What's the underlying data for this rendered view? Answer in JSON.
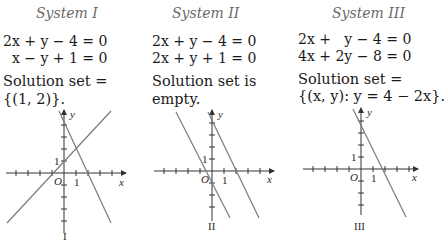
{
  "systems": [
    {
      "title": "System I",
      "equations": [
        "2x + y − 4 = 0",
        "  x − y + 1 = 0"
      ],
      "solution_line1": "Solution set =",
      "solution_line2": "{(1, 2)}.",
      "graph_label": "I",
      "axis_x": "x",
      "axis_y": "y",
      "origin": "O",
      "tick_x": "1",
      "tick_y": "1"
    },
    {
      "title": "System II",
      "equations": [
        "2x + y − 4 = 0",
        "2x + y + 1 = 0"
      ],
      "solution_line1": "Solution set is",
      "solution_line2": "empty.",
      "graph_label": "II",
      "axis_x": "x",
      "axis_y": "y",
      "origin": "O",
      "tick_x": "1",
      "tick_y": "1"
    },
    {
      "title": "System III",
      "equations": [
        "2x +   y − 4 = 0",
        "4x + 2y − 8 = 0"
      ],
      "solution_line1": "Solution set =",
      "solution_line2": "{(x, y): y = 4 − 2x}.",
      "graph_label": "III",
      "axis_x": "x",
      "axis_y": "y",
      "origin": "O",
      "tick_x": "1",
      "tick_y": "1"
    }
  ],
  "colors": {
    "line": "#7a7a7a",
    "axis": "#333333",
    "title": "#6a6a6a"
  }
}
